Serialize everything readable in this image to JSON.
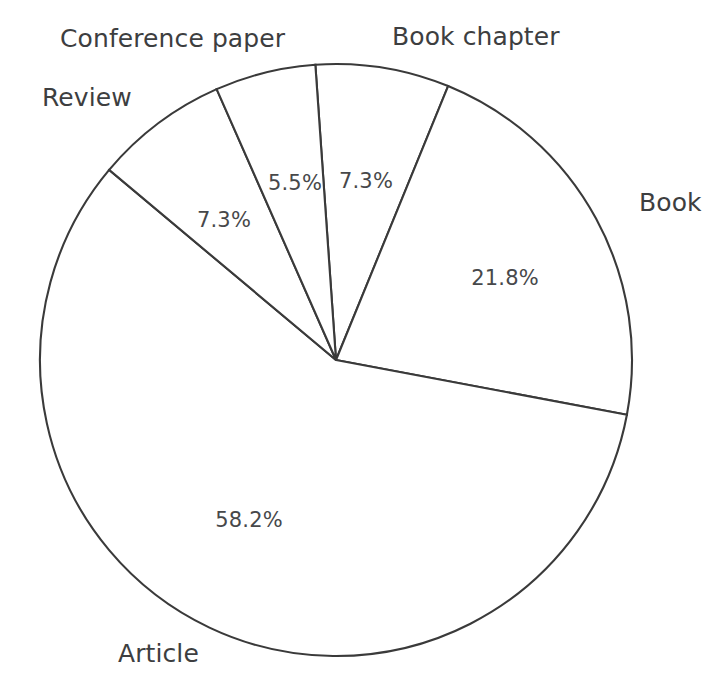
{
  "chart_data": {
    "type": "pie",
    "title": "",
    "subtitle": "",
    "xlabel": "",
    "ylabel": "",
    "grid": false,
    "legend": "none",
    "labels_position": "outside-categories-inside-percentages",
    "units": "percent",
    "total": 100.1,
    "start_angle_deg": -4,
    "direction": "clockwise",
    "categories": [
      "Book chapter",
      "Book",
      "Article",
      "Review",
      "Conference paper"
    ],
    "values": [
      7.3,
      21.8,
      58.2,
      7.3,
      5.5
    ],
    "slices": [
      {
        "name": "Book chapter",
        "value": 7.3,
        "value_label": "7.3%",
        "category_label": "Book chapter",
        "fill": "#ffffff",
        "stroke": "#3a3a3a"
      },
      {
        "name": "Book",
        "value": 21.8,
        "value_label": "21.8%",
        "category_label": "Book",
        "fill": "#ffffff",
        "stroke": "#3a3a3a"
      },
      {
        "name": "Article",
        "value": 58.2,
        "value_label": "58.2%",
        "category_label": "Article",
        "fill": "#ffffff",
        "stroke": "#3a3a3a"
      },
      {
        "name": "Review",
        "value": 7.3,
        "value_label": "7.3%",
        "category_label": "Review",
        "fill": "#ffffff",
        "stroke": "#3a3a3a"
      },
      {
        "name": "Conference paper",
        "value": 5.5,
        "value_label": "5.5%",
        "category_label": "Conference paper",
        "fill": "#ffffff",
        "stroke": "#3a3a3a"
      }
    ],
    "geometry": {
      "center_x": 336,
      "center_y": 360,
      "radius": 296
    },
    "percent_label_positions": [
      {
        "key": "book-chapter",
        "x": 366,
        "y": 181
      },
      {
        "key": "book",
        "x": 505,
        "y": 278
      },
      {
        "key": "article",
        "x": 249,
        "y": 520
      },
      {
        "key": "review",
        "x": 224,
        "y": 220
      },
      {
        "key": "conference-paper",
        "x": 295,
        "y": 183
      }
    ],
    "category_label_positions": [
      {
        "key": "conference-paper",
        "x": 60,
        "y": 24
      },
      {
        "key": "book-chapter",
        "x": 392,
        "y": 22
      },
      {
        "key": "review",
        "x": 42,
        "y": 83
      },
      {
        "key": "book",
        "x": 639,
        "y": 188
      },
      {
        "key": "article",
        "x": 118,
        "y": 639
      }
    ],
    "colors": {
      "background": "#ffffff",
      "slice_fill": "#ffffff",
      "outline": "#3a3a3a",
      "percent_text": "#47484a",
      "category_text": "#3d3e40"
    }
  }
}
